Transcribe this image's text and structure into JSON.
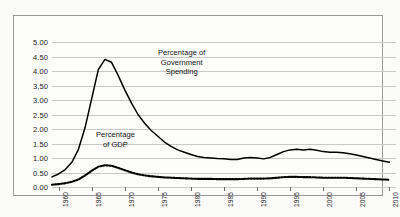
{
  "chart_data": {
    "type": "line",
    "title": "",
    "xlabel": "",
    "ylabel": "",
    "xlim": [
      1959,
      2011
    ],
    "ylim": [
      0.0,
      5.0
    ],
    "grid": true,
    "legend": "annotations-inline",
    "ytick_labels": [
      "0.00",
      "0.50",
      "1.00",
      "1.50",
      "2.00",
      "2.50",
      "3.00",
      "3.50",
      "4.00",
      "4.50",
      "5.00"
    ],
    "ytick_values": [
      0.0,
      0.5,
      1.0,
      1.5,
      2.0,
      2.5,
      3.0,
      3.5,
      4.0,
      4.5,
      5.0
    ],
    "xtick_labels": [
      "1960",
      "1965",
      "1970",
      "1975",
      "1980",
      "1985",
      "1990",
      "1995",
      "2000",
      "2005",
      "2010"
    ],
    "xtick_values": [
      1960,
      1965,
      1970,
      1975,
      1980,
      1985,
      1990,
      1995,
      2000,
      2005,
      2010
    ],
    "annotations": [
      {
        "name": "government-spending-label",
        "text": "Percentage of\nGovernment\nSpending"
      },
      {
        "name": "gdp-label",
        "text": "Percentage\nof GDP"
      }
    ],
    "series": [
      {
        "name": "Percentage of Government Spending",
        "style": "solid",
        "color": "#000000",
        "x": [
          1959,
          1960,
          1961,
          1962,
          1963,
          1964,
          1965,
          1966,
          1967,
          1968,
          1969,
          1970,
          1971,
          1972,
          1973,
          1974,
          1975,
          1976,
          1977,
          1978,
          1979,
          1980,
          1981,
          1982,
          1983,
          1984,
          1985,
          1986,
          1987,
          1988,
          1989,
          1990,
          1991,
          1992,
          1993,
          1994,
          1995,
          1996,
          1997,
          1998,
          1999,
          2000,
          2001,
          2002,
          2003,
          2004,
          2005,
          2006,
          2007,
          2008,
          2009,
          2010
        ],
        "values": [
          0.35,
          0.45,
          0.6,
          0.85,
          1.3,
          2.05,
          3.05,
          4.05,
          4.4,
          4.3,
          3.85,
          3.35,
          2.9,
          2.5,
          2.2,
          1.95,
          1.75,
          1.55,
          1.4,
          1.28,
          1.2,
          1.12,
          1.05,
          1.02,
          1.0,
          0.98,
          0.97,
          0.95,
          0.95,
          1.0,
          1.02,
          1.0,
          0.97,
          1.02,
          1.12,
          1.22,
          1.28,
          1.3,
          1.28,
          1.3,
          1.27,
          1.22,
          1.2,
          1.2,
          1.18,
          1.15,
          1.1,
          1.05,
          1.0,
          0.95,
          0.9,
          0.85
        ]
      },
      {
        "name": "Percentage of GDP",
        "style": "dotted",
        "color": "#000000",
        "x": [
          1959,
          1960,
          1961,
          1962,
          1963,
          1964,
          1965,
          1966,
          1967,
          1968,
          1969,
          1970,
          1971,
          1972,
          1973,
          1974,
          1975,
          1976,
          1977,
          1978,
          1979,
          1980,
          1981,
          1982,
          1983,
          1984,
          1985,
          1986,
          1987,
          1988,
          1989,
          1990,
          1991,
          1992,
          1993,
          1994,
          1995,
          1996,
          1997,
          1998,
          1999,
          2000,
          2001,
          2002,
          2003,
          2004,
          2005,
          2006,
          2007,
          2008,
          2009,
          2010
        ],
        "values": [
          0.08,
          0.1,
          0.13,
          0.18,
          0.26,
          0.4,
          0.56,
          0.7,
          0.75,
          0.73,
          0.66,
          0.58,
          0.5,
          0.44,
          0.4,
          0.37,
          0.35,
          0.33,
          0.32,
          0.31,
          0.3,
          0.29,
          0.28,
          0.28,
          0.28,
          0.27,
          0.27,
          0.27,
          0.27,
          0.28,
          0.29,
          0.29,
          0.29,
          0.3,
          0.32,
          0.34,
          0.35,
          0.35,
          0.34,
          0.34,
          0.33,
          0.32,
          0.32,
          0.32,
          0.32,
          0.31,
          0.3,
          0.29,
          0.28,
          0.27,
          0.26,
          0.25
        ]
      }
    ]
  }
}
